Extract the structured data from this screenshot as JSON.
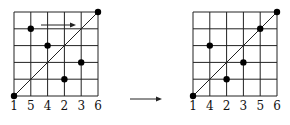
{
  "diagrams": [
    {
      "name": "before",
      "labels": [
        "1",
        "5",
        "4",
        "2",
        "3",
        "6"
      ],
      "points": [
        [
          0,
          0
        ],
        [
          1,
          4
        ],
        [
          2,
          3
        ],
        [
          3,
          1
        ],
        [
          4,
          2
        ],
        [
          5,
          5
        ]
      ],
      "has_arrow": true
    },
    {
      "name": "after",
      "labels": [
        "1",
        "4",
        "2",
        "3",
        "5",
        "6"
      ],
      "points": [
        [
          0,
          0
        ],
        [
          1,
          3
        ],
        [
          2,
          1
        ],
        [
          3,
          2
        ],
        [
          4,
          4
        ],
        [
          5,
          5
        ]
      ],
      "has_arrow": false
    }
  ],
  "colors": {
    "line": "#222222",
    "dot": "#000000"
  }
}
